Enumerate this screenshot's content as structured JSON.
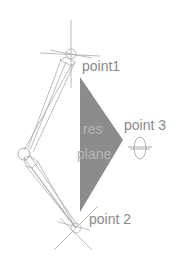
{
  "diagram": {
    "background": "#ffffff",
    "colors": {
      "line": "#9a9a9a",
      "plane_fill": "#8c8c8c",
      "label": "#8a8a8a",
      "plane_label": "#b4b4b4"
    },
    "labels": {
      "point1": "point1",
      "point2": "point 2",
      "point3": "point 3",
      "plane_line1": "res",
      "plane_line2": "plane"
    },
    "nodes": [
      {
        "id": "point1",
        "type": "locator-cross",
        "x": 71,
        "y": 54
      },
      {
        "id": "point2",
        "type": "locator-cross",
        "x": 76,
        "y": 228
      },
      {
        "id": "point3",
        "type": "locator-ellipse",
        "x": 140,
        "y": 148
      },
      {
        "id": "elbow-joint",
        "type": "joint-circle",
        "x": 24,
        "y": 154
      }
    ],
    "plane": {
      "type": "triangle",
      "vertices": [
        [
          80,
          77
        ],
        [
          123,
          140
        ],
        [
          80,
          212
        ]
      ]
    }
  }
}
